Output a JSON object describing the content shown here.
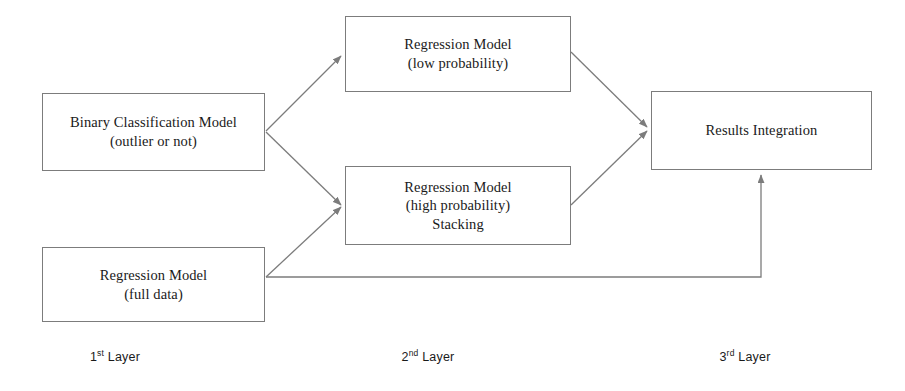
{
  "diagram": {
    "line_color": "#7c7c7c",
    "text_color": "#1a1a1a",
    "background": "#ffffff",
    "nodes": [
      {
        "id": "binary-classification-model",
        "lines": [
          "Binary Classification Model",
          "(outlier or not)"
        ],
        "x": 42,
        "y": 93,
        "w": 223,
        "h": 78
      },
      {
        "id": "regression-model-low-probability",
        "lines": [
          "Regression Model",
          "(low probability)"
        ],
        "x": 345,
        "y": 16,
        "w": 226,
        "h": 76
      },
      {
        "id": "regression-model-high-probability-stacking",
        "lines": [
          "Regression Model",
          "(high probability)",
          "Stacking"
        ],
        "x": 345,
        "y": 166,
        "w": 226,
        "h": 79
      },
      {
        "id": "regression-model-full-data",
        "lines": [
          "Regression Model",
          "(full data)"
        ],
        "x": 42,
        "y": 247,
        "w": 223,
        "h": 75
      },
      {
        "id": "results-integration",
        "lines": [
          "Results Integration"
        ],
        "x": 651,
        "y": 91,
        "w": 221,
        "h": 79
      }
    ],
    "edges": [
      {
        "id": "binary-to-low-probability",
        "from": "binary-classification-model",
        "to": "regression-model-low-probability",
        "path": "M 266 131 L 341 56",
        "arrow": true
      },
      {
        "id": "binary-to-high-probability",
        "from": "binary-classification-model",
        "to": "regression-model-high-probability-stacking",
        "path": "M 266 132 L 341 205",
        "arrow": true
      },
      {
        "id": "full-data-to-high-probability",
        "from": "regression-model-full-data",
        "to": "regression-model-high-probability-stacking",
        "path": "M 266 277 L 341 207",
        "arrow": true
      },
      {
        "id": "low-probability-to-results",
        "from": "regression-model-low-probability",
        "to": "results-integration",
        "path": "M 571 52 L 647 127",
        "arrow": true
      },
      {
        "id": "high-probability-to-results",
        "from": "regression-model-high-probability-stacking",
        "to": "results-integration",
        "path": "M 571 205 L 647 131",
        "arrow": true
      },
      {
        "id": "full-data-to-results",
        "from": "regression-model-full-data",
        "to": "results-integration",
        "path": "M 266 277 L 761 277 L 761 175",
        "arrow": true
      }
    ],
    "layer_labels": [
      {
        "id": "layer-1",
        "ordinal": "1",
        "suffix": "st",
        "text": " Layer",
        "x": 115,
        "y": 350
      },
      {
        "id": "layer-2",
        "ordinal": "2",
        "suffix": "nd",
        "text": " Layer",
        "x": 428,
        "y": 350
      },
      {
        "id": "layer-3",
        "ordinal": "3",
        "suffix": "rd",
        "text": " Layer",
        "x": 745,
        "y": 350
      }
    ]
  }
}
